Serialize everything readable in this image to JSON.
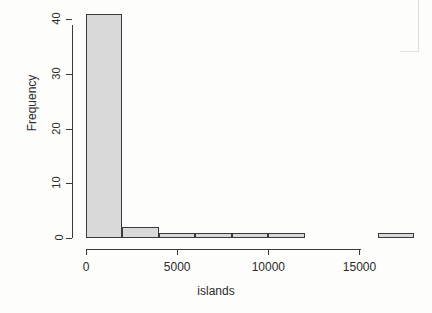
{
  "chart_data": {
    "type": "bar",
    "subtype": "histogram",
    "title": "",
    "subtitle": "",
    "xlabel": "islands",
    "ylabel": "Frequency",
    "xlim": [
      0,
      18100
    ],
    "ylim": [
      0,
      41
    ],
    "grid": false,
    "legend": null,
    "bin_width": 2000,
    "bin_edges": [
      0,
      2000,
      4000,
      6000,
      8000,
      10000,
      12000,
      14000,
      16000,
      18000
    ],
    "categories": [
      "0-2000",
      "2000-4000",
      "4000-6000",
      "6000-8000",
      "8000-10000",
      "10000-12000",
      "12000-14000",
      "14000-16000",
      "16000-18000"
    ],
    "values": [
      41,
      2,
      1,
      1,
      1,
      1,
      0,
      0,
      1
    ],
    "bars": [
      {
        "x0": 0,
        "x1": 2000,
        "count": 41
      },
      {
        "x0": 2000,
        "x1": 4000,
        "count": 2
      },
      {
        "x0": 4000,
        "x1": 6000,
        "count": 1
      },
      {
        "x0": 6000,
        "x1": 8000,
        "count": 1
      },
      {
        "x0": 8000,
        "x1": 10000,
        "count": 1
      },
      {
        "x0": 10000,
        "x1": 12000,
        "count": 1
      },
      {
        "x0": 12000,
        "x1": 14000,
        "count": 0
      },
      {
        "x0": 14000,
        "x1": 16000,
        "count": 0
      },
      {
        "x0": 16000,
        "x1": 18000,
        "count": 1
      }
    ],
    "x_ticks": [
      0,
      5000,
      10000,
      15000
    ],
    "x_tick_labels": [
      "0",
      "5000",
      "10000",
      "15000"
    ],
    "y_ticks": [
      0,
      10,
      20,
      30,
      40
    ],
    "y_tick_labels": [
      "0",
      "10",
      "20",
      "30",
      "40"
    ],
    "colors": {
      "bar_fill": "#d9d9d9",
      "bar_border": "#3a3a3a",
      "axis": "#3a3a3a",
      "text": "#2b2b2b",
      "background": "#fdfdfc"
    }
  }
}
